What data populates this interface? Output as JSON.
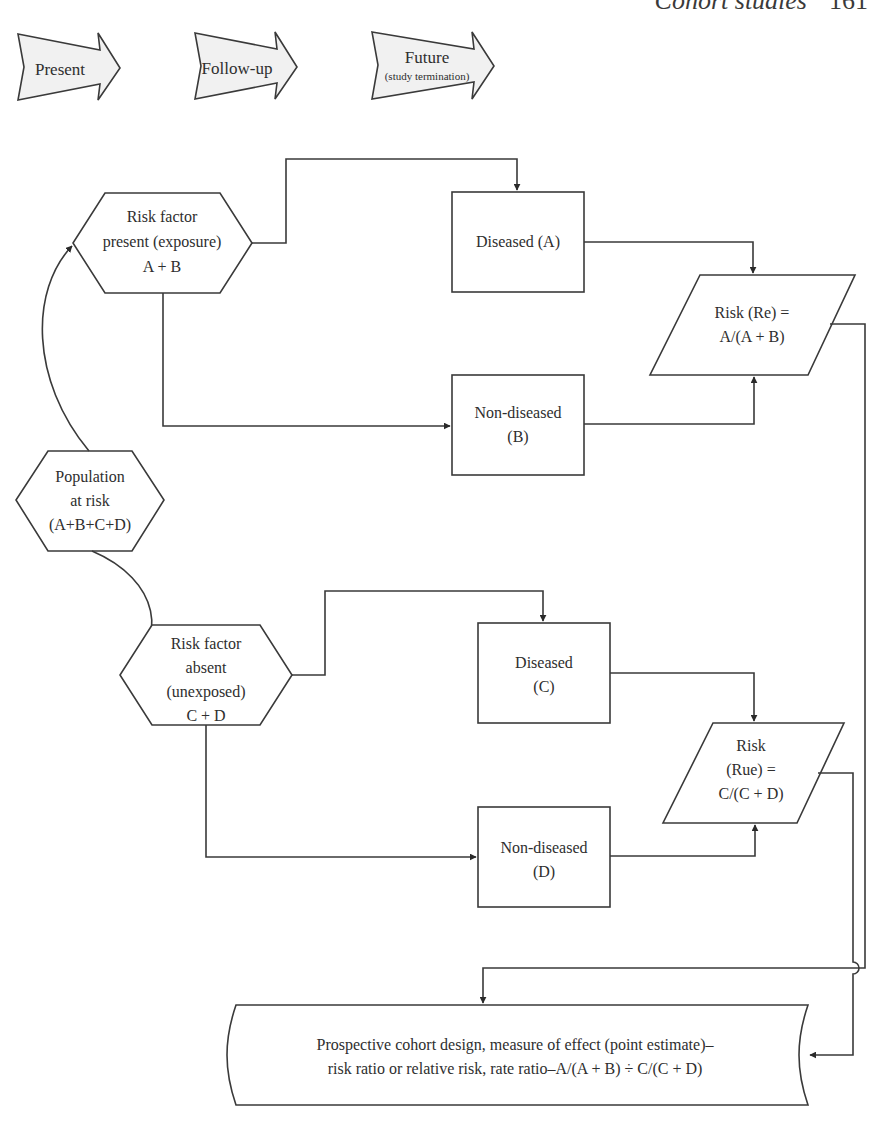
{
  "running_head": {
    "title": "Cohort studies",
    "page_number": "161"
  },
  "timeline": [
    {
      "label": "Present",
      "sublabel": ""
    },
    {
      "label": "Follow-up",
      "sublabel": ""
    },
    {
      "label": "Future",
      "sublabel": "(study termination)"
    }
  ],
  "nodes": {
    "population": {
      "lines": [
        "Population",
        "at risk",
        "(A+B+C+D)"
      ]
    },
    "exposed": {
      "lines": [
        "Risk factor",
        "present (exposure)",
        "A + B"
      ]
    },
    "unexposed": {
      "lines": [
        "Risk factor",
        "absent",
        "(unexposed)",
        "C + D"
      ]
    },
    "diseased_a": {
      "lines": [
        "Diseased (A)"
      ]
    },
    "nondiseased_b": {
      "lines": [
        "Non-diseased",
        "(B)"
      ]
    },
    "diseased_c": {
      "lines": [
        "Diseased",
        "(C)"
      ]
    },
    "nondiseased_d": {
      "lines": [
        "Non-diseased",
        "(D)"
      ]
    },
    "risk_re": {
      "lines": [
        "Risk (Re) =",
        "A/(A + B)"
      ]
    },
    "risk_rue": {
      "lines": [
        "Risk",
        "(Rue) =",
        "C/(C + D)"
      ]
    },
    "result": {
      "lines": [
        "Prospective cohort design, measure of effect (point estimate)–",
        "risk ratio or relative risk, rate ratio–A/(A + B) ÷ C/(C + D)"
      ]
    }
  },
  "colors": {
    "stroke": "#3a3a3a",
    "arrow_fill": "#f1f1f1",
    "text": "#2e2e2e"
  }
}
